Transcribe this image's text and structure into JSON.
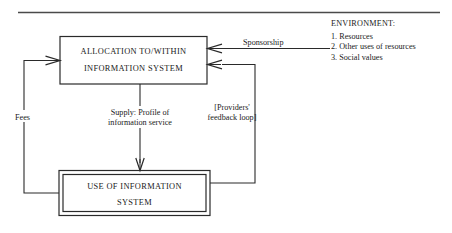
{
  "figure": {
    "top_rule": true
  },
  "nodes": {
    "allocation": {
      "line1": "ALLOCATION TO/WITHIN",
      "line2": "INFORMATION SYSTEM"
    },
    "use": {
      "line1": "USE OF INFORMATION",
      "line2": "SYSTEM"
    }
  },
  "edges": {
    "sponsorship": {
      "label": "Sponsorship"
    },
    "fees": {
      "label": "Fees"
    },
    "supply": {
      "line1": "Supply: Profile of",
      "line2": "information service"
    },
    "feedback": {
      "line1": "[Providers'",
      "line2": "feedback loop]"
    }
  },
  "environment": {
    "heading": "ENVIRONMENT:",
    "items": [
      "1. Resources",
      "2. Other uses of resources",
      "3. Social values"
    ]
  },
  "colors": {
    "ink": "#1a1a1a",
    "rule": "#4a4a4a",
    "background": "#ffffff"
  }
}
